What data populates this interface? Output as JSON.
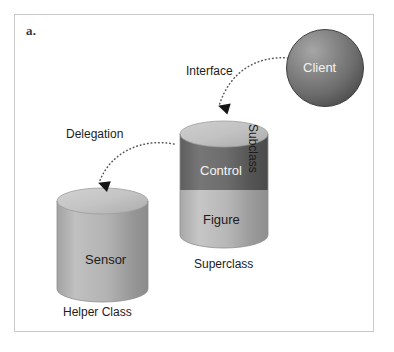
{
  "figure": {
    "panel_letter": "a.",
    "background_color": "#ffffff",
    "border_color": "#c9c9c9"
  },
  "nodes": {
    "client": {
      "label": "Client",
      "shape": "sphere",
      "fill_color": "#6e6e6e",
      "highlight_color": "#9a9a9a",
      "edge_color": "#454545",
      "text_color": "#f2f2f2"
    },
    "subclass_cylinder": {
      "side_label": "Subclass",
      "bottom_label": "Superclass",
      "shape": "cylinder",
      "top_fill": "#c3c3c3",
      "segments": [
        {
          "label": "Control",
          "fill_color": "#6a6a6a",
          "text_color": "#f4f4f4"
        },
        {
          "label": "Figure",
          "fill_color": "#b5b5b5",
          "text_color": "#1c1c1c"
        }
      ]
    },
    "helper_cylinder": {
      "label": "Sensor",
      "bottom_label": "Helper Class",
      "shape": "cylinder",
      "top_fill": "#c7c7c7",
      "body_fill": "#b0b0b0",
      "text_color": "#1c1c1c"
    }
  },
  "connectors": [
    {
      "label": "Interface",
      "from": "client",
      "to": "subclass_cylinder",
      "style": "dotted-curved-arrow",
      "color": "#555555"
    },
    {
      "label": "Delegation",
      "from": "subclass_cylinder",
      "to": "helper_cylinder",
      "style": "dotted-curved-arrow",
      "color": "#555555"
    }
  ]
}
